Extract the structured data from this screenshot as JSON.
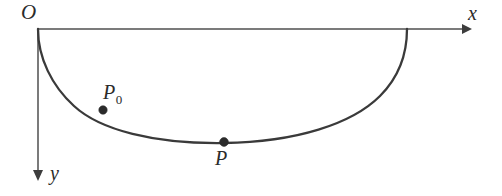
{
  "figure": {
    "kind": "brachistochrone-cycloid-diagram",
    "background_color": "#ffffff",
    "ink_color": "#3a3a3a",
    "labels": {
      "origin": "O",
      "x_axis": "x",
      "y_axis": "y",
      "point_p0_base": "P",
      "point_p0_subscript": "0",
      "point_p": "P"
    },
    "axes": {
      "origin_px": [
        38,
        29
      ],
      "x_axis_end_px": [
        471,
        29
      ],
      "y_axis_end_px": [
        38,
        180
      ],
      "x_direction": "right",
      "y_direction": "down"
    },
    "curve": {
      "type": "cycloid",
      "start_px": [
        38,
        29
      ],
      "lowest_point_px": [
        224,
        143
      ],
      "end_px": [
        407,
        29
      ],
      "path": "M 38 29 C 38 58, 52 86, 74 106 C 100 130, 154 144, 224 143 C 296 142, 352 124, 380 96 C 400 76, 407 52, 407 29"
    },
    "markers": [
      {
        "name": "P0",
        "x_px": 103,
        "y_px": 110
      },
      {
        "name": "P",
        "x_px": 224,
        "y_px": 142
      }
    ]
  }
}
